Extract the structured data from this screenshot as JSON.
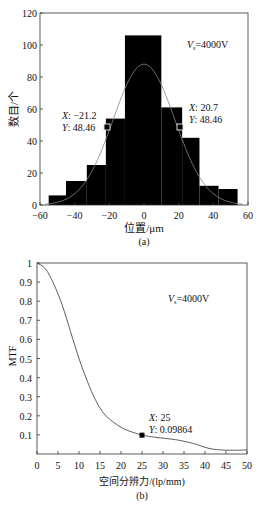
{
  "chart_data": [
    {
      "type": "bar",
      "subtype": "histogram-with-gaussian-fit",
      "title": "",
      "xlabel": "位置/μm",
      "ylabel": "数目/个",
      "caption": "(a)",
      "xlim": [
        -60,
        60
      ],
      "ylim": [
        0,
        120
      ],
      "xticks": [
        -60,
        -40,
        -20,
        0,
        20,
        40,
        60
      ],
      "yticks": [
        0,
        20,
        40,
        60,
        80,
        100,
        120
      ],
      "xtick_labels": [
        "−60",
        "−40",
        "−20",
        "0",
        "20",
        "40",
        "60"
      ],
      "ytick_labels": [
        "0",
        "20",
        "40",
        "60",
        "80",
        "100",
        "120"
      ],
      "bins": [
        {
          "x0": -55,
          "x1": -45,
          "count": 6
        },
        {
          "x0": -45,
          "x1": -33,
          "count": 15
        },
        {
          "x0": -33,
          "x1": -22,
          "count": 25
        },
        {
          "x0": -22,
          "x1": -11,
          "count": 54
        },
        {
          "x0": -11,
          "x1": 10,
          "count": 106
        },
        {
          "x0": 10,
          "x1": 22,
          "count": 61
        },
        {
          "x0": 22,
          "x1": 32,
          "count": 42
        },
        {
          "x0": 32,
          "x1": 43,
          "count": 12
        },
        {
          "x0": 43,
          "x1": 54,
          "count": 10
        }
      ],
      "fit": {
        "type": "gaussian",
        "peak": 88,
        "center": 0,
        "half_max_x": [
          -21.2,
          20.7
        ]
      },
      "annotation": {
        "text": "Vs=4000V",
        "var": "V",
        "sub": "s",
        "rest": "=4000V"
      },
      "datatips": [
        {
          "x_label": "X",
          "x_value": "−21.2",
          "y_label": "Y",
          "y_value": "48.46",
          "x": -21.2,
          "y": 48.46,
          "marker": "hollow-square"
        },
        {
          "x_label": "X",
          "x_value": "20.7",
          "y_label": "Y",
          "y_value": "48.46",
          "x": 20.7,
          "y": 48.46,
          "marker": "filled-square"
        }
      ],
      "grid": false,
      "legend": null
    },
    {
      "type": "line",
      "title": "",
      "xlabel": "空间分辨力/(lp/mm)",
      "ylabel": "MTF",
      "caption": "(b)",
      "xlim": [
        0,
        50
      ],
      "ylim": [
        0,
        1
      ],
      "xticks": [
        0,
        5,
        10,
        15,
        20,
        25,
        30,
        35,
        40,
        45,
        50
      ],
      "yticks": [
        0.1,
        0.2,
        0.3,
        0.4,
        0.5,
        0.6,
        0.7,
        0.8,
        0.9,
        1
      ],
      "xtick_labels": [
        "0",
        "5",
        "10",
        "15",
        "20",
        "25",
        "30",
        "35",
        "40",
        "45",
        "50"
      ],
      "ytick_labels": [
        "0.1",
        "0.2",
        "0.3",
        "0.4",
        "0.5",
        "0.6",
        "0.7",
        "0.8",
        "0.9",
        "1"
      ],
      "series": [
        {
          "name": "MTF",
          "x": [
            0,
            2,
            4,
            6,
            8,
            10,
            12,
            14,
            16,
            18,
            20,
            22,
            25,
            28,
            30,
            33,
            36,
            38,
            40,
            42,
            45,
            48,
            50
          ],
          "y": [
            1.0,
            0.97,
            0.89,
            0.78,
            0.64,
            0.5,
            0.38,
            0.28,
            0.21,
            0.17,
            0.14,
            0.12,
            0.099,
            0.088,
            0.083,
            0.075,
            0.062,
            0.05,
            0.035,
            0.025,
            0.02,
            0.02,
            0.022
          ]
        }
      ],
      "annotation": {
        "text": "Vs=4000V",
        "var": "V",
        "sub": "s",
        "rest": "=4000V"
      },
      "datatips": [
        {
          "x_label": "X",
          "x_value": "25",
          "y_label": "Y",
          "y_value": "0.09864",
          "x": 25,
          "y": 0.09864,
          "marker": "filled-square"
        }
      ],
      "grid": false,
      "legend": null
    }
  ]
}
